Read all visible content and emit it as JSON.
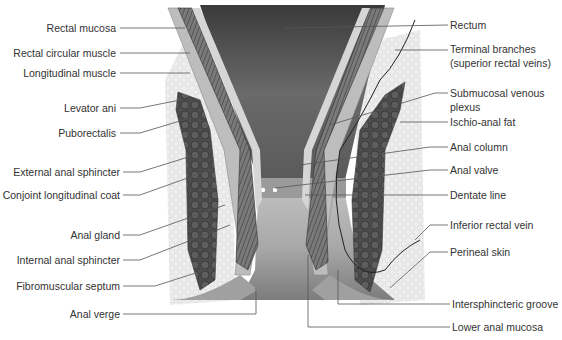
{
  "diagram": {
    "colors": {
      "background": "#ffffff",
      "label_text": "#333333",
      "leader_line": "#555555",
      "muscle_dark": "#4a4a4a",
      "mucosa_light": "#c8c8c8",
      "fat": "#e6e6e6"
    },
    "labels_left": [
      {
        "id": "rectal-mucosa",
        "text": "Rectal mucosa"
      },
      {
        "id": "rectal-circular-muscle",
        "text": "Rectal circular muscle"
      },
      {
        "id": "longitudinal-muscle",
        "text": "Longitudinal muscle"
      },
      {
        "id": "levator-ani",
        "text": "Levator ani"
      },
      {
        "id": "puborectalis",
        "text": "Puborectalis"
      },
      {
        "id": "external-anal-sphincter",
        "text": "External anal sphincter"
      },
      {
        "id": "conjoint-longitudinal-coat",
        "text": "Conjoint longitudinal coat"
      },
      {
        "id": "anal-gland",
        "text": "Anal gland"
      },
      {
        "id": "internal-anal-sphincter",
        "text": "Internal anal sphincter"
      },
      {
        "id": "fibromuscular-septum",
        "text": "Fibromuscular septum"
      },
      {
        "id": "anal-verge",
        "text": "Anal verge"
      }
    ],
    "labels_right": [
      {
        "id": "rectum",
        "text": "Rectum"
      },
      {
        "id": "terminal-branches",
        "text": "Terminal branches",
        "text2": "(superior rectal veins)"
      },
      {
        "id": "submucosal-venous-plexus",
        "text": "Submucosal venous",
        "text2": "plexus"
      },
      {
        "id": "ischio-anal-fat",
        "text": "Ischio-anal fat"
      },
      {
        "id": "anal-column",
        "text": "Anal column"
      },
      {
        "id": "anal-valve",
        "text": "Anal valve"
      },
      {
        "id": "dentate-line",
        "text": "Dentate line"
      },
      {
        "id": "inferior-rectal-vein",
        "text": "Inferior rectal vein"
      },
      {
        "id": "perineal-skin",
        "text": "Perineal skin"
      },
      {
        "id": "intersphincteric-groove",
        "text": "Intersphincteric groove"
      },
      {
        "id": "lower-anal-mucosa",
        "text": "Lower anal mucosa"
      }
    ]
  }
}
